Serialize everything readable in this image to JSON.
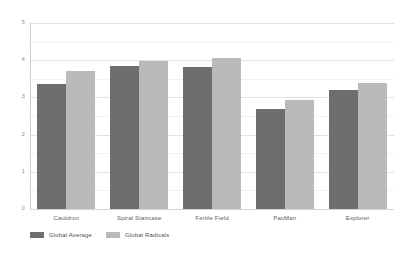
{
  "chart_data": {
    "type": "bar",
    "title": "",
    "xlabel": "",
    "ylabel": "",
    "ylim": [
      0,
      5
    ],
    "y_ticks": [
      "0",
      "1",
      "2",
      "3",
      "4",
      "5"
    ],
    "y_tick_values": [
      0,
      1,
      2,
      3,
      4,
      5
    ],
    "minor_gridlines": [
      0.5,
      1.5,
      2.5,
      3.5,
      4.5
    ],
    "grid": true,
    "legend_position": "bottom-left",
    "categories": [
      "Cauldron",
      "Spiral Staircase",
      "Fertile Field",
      "PacMan",
      "Explorer"
    ],
    "series": [
      {
        "name": "Global Average",
        "color": "#6e6e6e",
        "values": [
          3.37,
          3.85,
          3.82,
          2.69,
          3.21
        ]
      },
      {
        "name": "Global Radicals",
        "color": "#bababa",
        "values": [
          3.7,
          3.98,
          4.06,
          2.93,
          3.4
        ]
      }
    ]
  },
  "colors": {
    "background": "#ffffff",
    "grid_minor": "#f1f1f1",
    "grid_major": "#e2e2e2",
    "axis": "#cfcfcf",
    "tick_text": "#8a8a8a",
    "category_text": "#5e5e5e",
    "legend_text": "#4f4f4f"
  }
}
